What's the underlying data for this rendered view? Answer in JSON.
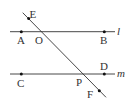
{
  "diagram": {
    "colors": {
      "line": "#333333",
      "point": "#111111",
      "background": "#ffffff"
    },
    "lines": {
      "l": {
        "label": "l",
        "y": 31.7,
        "x1": 10,
        "x2": 115
      },
      "m": {
        "label": "m",
        "y": 74,
        "x1": 10,
        "x2": 115
      },
      "transversal": {
        "x1": 22.7,
        "y1": 12.7,
        "x2": 106,
        "y2": 97.3
      }
    },
    "points": {
      "E": {
        "label": "E",
        "x": 28.7,
        "y": 18,
        "dot": true
      },
      "A": {
        "label": "A",
        "x": 21.3,
        "y": 31.7,
        "dot": true
      },
      "O": {
        "label": "O",
        "x": 42.7,
        "y": 31.7,
        "dot": false
      },
      "B": {
        "label": "B",
        "x": 104.3,
        "y": 31.7,
        "dot": true
      },
      "C": {
        "label": "C",
        "x": 21.3,
        "y": 74,
        "dot": true
      },
      "P": {
        "label": "P",
        "x": 83.3,
        "y": 74,
        "dot": false
      },
      "D": {
        "label": "D",
        "x": 104.3,
        "y": 74,
        "dot": true
      },
      "F": {
        "label": "F",
        "x": 99.3,
        "y": 90.7,
        "dot": true
      }
    }
  }
}
